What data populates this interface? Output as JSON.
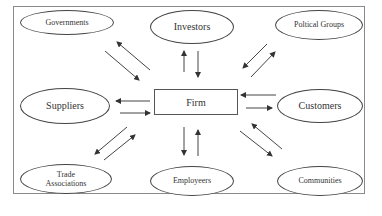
{
  "diagram": {
    "type": "stakeholder-map",
    "center": {
      "label": "Firm"
    },
    "nodes": [
      {
        "id": "governments",
        "label": "Governments"
      },
      {
        "id": "investors",
        "label": "Investors"
      },
      {
        "id": "political-groups",
        "label": "Poltical Groups"
      },
      {
        "id": "suppliers",
        "label": "Suppliers"
      },
      {
        "id": "customers",
        "label": "Customers"
      },
      {
        "id": "trade-associations",
        "label": "Trade Associations",
        "lines": [
          "Trade",
          "Associations"
        ]
      },
      {
        "id": "employeers",
        "label": "Employeers"
      },
      {
        "id": "communities",
        "label": "Communities"
      }
    ],
    "edges": [
      {
        "from": "Firm",
        "to": "Governments",
        "bidirectional": true
      },
      {
        "from": "Firm",
        "to": "Investors",
        "bidirectional": true
      },
      {
        "from": "Firm",
        "to": "Poltical Groups",
        "bidirectional": true
      },
      {
        "from": "Firm",
        "to": "Suppliers",
        "bidirectional": true
      },
      {
        "from": "Firm",
        "to": "Customers",
        "bidirectional": true
      },
      {
        "from": "Firm",
        "to": "Trade Associations",
        "bidirectional": true
      },
      {
        "from": "Firm",
        "to": "Employeers",
        "bidirectional": true
      },
      {
        "from": "Firm",
        "to": "Communities",
        "bidirectional": true
      }
    ],
    "colors": {
      "line": "#444444",
      "frame": "#8a8a8a",
      "background": "#ffffff",
      "text": "#333333"
    }
  }
}
